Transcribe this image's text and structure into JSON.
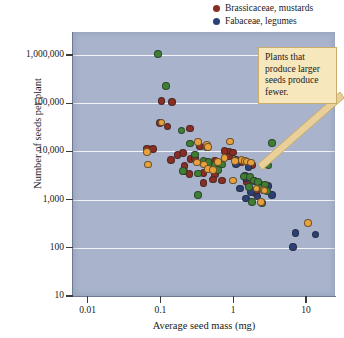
{
  "legend": {
    "items": [
      {
        "label": "Brassicaceae, mustards",
        "color": "#8a2d22",
        "icon": "legend-dot-icon"
      },
      {
        "label": "Fabaceae, legumes",
        "color": "#2b3f78",
        "icon": "legend-dot-icon"
      }
    ]
  },
  "annotation": {
    "text": "Plants that produce larger seeds produce fewer.",
    "background": "#f7e7bd",
    "border": "#c9ab6a"
  },
  "chart_data": {
    "type": "scatter",
    "title": "",
    "xlabel": "Average seed mass (mg)",
    "ylabel": "Number of seeds per plant",
    "xscale": "log",
    "yscale": "log",
    "xlim": [
      0.0063,
      25
    ],
    "ylim": [
      10,
      3000000
    ],
    "xticks": [
      0.01,
      0.1,
      1,
      10
    ],
    "xtick_labels": [
      "0.01",
      "0.1",
      "1",
      "10"
    ],
    "yticks": [
      10,
      100,
      1000,
      10000,
      100000,
      1000000
    ],
    "ytick_labels": [
      "10",
      "100",
      "1,000",
      "10,000",
      "100,000",
      "1,000,000"
    ],
    "grid": "horizontal",
    "legend_position": "top-right",
    "plot_background": "#a9b4cc",
    "gridline_color": "#f2f4f8",
    "series": [
      {
        "name": "Brassicaceae, mustards",
        "color": "#8a2d22",
        "points": [
          [
            0.104,
            110000
          ],
          [
            0.143,
            106000
          ],
          [
            0.098,
            39000
          ],
          [
            0.125,
            33000
          ],
          [
            0.255,
            30000
          ],
          [
            0.066,
            11500
          ],
          [
            0.079,
            11200
          ],
          [
            0.35,
            12600
          ],
          [
            0.205,
            9300
          ],
          [
            0.171,
            8400
          ],
          [
            0.26,
            6900
          ],
          [
            0.3,
            7100
          ],
          [
            0.215,
            5000
          ],
          [
            0.44,
            6200
          ],
          [
            0.56,
            6400
          ],
          [
            0.14,
            6700
          ],
          [
            0.21,
            3800
          ],
          [
            0.25,
            3400
          ],
          [
            0.39,
            3600
          ],
          [
            0.56,
            3300
          ],
          [
            0.53,
            2600
          ],
          [
            0.87,
            9700
          ],
          [
            0.88,
            7900
          ],
          [
            1.1,
            6600
          ],
          [
            1.3,
            5900
          ],
          [
            0.39,
            2200
          ],
          [
            0.7,
            2500
          ],
          [
            1.55,
            2300
          ],
          [
            1.8,
            5200
          ],
          [
            0.76,
            10300
          ],
          [
            1.0,
            9400
          ],
          [
            2.05,
            1350
          ]
        ]
      },
      {
        "name": "Fabaceae, legumes",
        "color": "#2b3f78",
        "points": [
          [
            1.1,
            5500
          ],
          [
            1.45,
            3100
          ],
          [
            1.5,
            2800
          ],
          [
            1.62,
            4800
          ],
          [
            1.95,
            2400
          ],
          [
            2.3,
            2100
          ],
          [
            1.25,
            1700
          ],
          [
            1.75,
            1450
          ],
          [
            2.6,
            1550
          ],
          [
            2.15,
            1150
          ],
          [
            1.5,
            1050
          ],
          [
            3.0,
            1900
          ],
          [
            3.4,
            1250
          ],
          [
            7.2,
            200
          ],
          [
            13.5,
            190
          ],
          [
            6.6,
            105
          ]
        ]
      },
      {
        "name": "Other family (green)",
        "color": "#3f7f33",
        "points": [
          [
            0.093,
            1050000
          ],
          [
            0.12,
            230000
          ],
          [
            0.196,
            27000
          ],
          [
            0.255,
            14500
          ],
          [
            0.44,
            12300
          ],
          [
            0.3,
            8600
          ],
          [
            0.39,
            6400
          ],
          [
            0.46,
            6100
          ],
          [
            0.56,
            5200
          ],
          [
            0.205,
            3900
          ],
          [
            0.33,
            3500
          ],
          [
            0.62,
            4100
          ],
          [
            0.33,
            1250
          ],
          [
            1.4,
            3000
          ],
          [
            1.7,
            2950
          ],
          [
            1.9,
            2500
          ],
          [
            2.2,
            2350
          ],
          [
            1.65,
            1800
          ],
          [
            2.4,
            1750
          ],
          [
            2.75,
            2050
          ],
          [
            1.8,
            900
          ],
          [
            2.5,
            850
          ],
          [
            3.4,
            14800
          ],
          [
            3.05,
            5100
          ],
          [
            2.9,
            1500
          ],
          [
            0.7,
            5400
          ]
        ]
      },
      {
        "name": "Other family (orange)",
        "color": "#e8a13b",
        "points": [
          [
            0.104,
            39500
          ],
          [
            0.066,
            9600
          ],
          [
            0.068,
            5300
          ],
          [
            0.33,
            15800
          ],
          [
            0.44,
            13500
          ],
          [
            0.45,
            12400
          ],
          [
            0.9,
            16200
          ],
          [
            0.32,
            5900
          ],
          [
            0.4,
            5300
          ],
          [
            0.45,
            4300
          ],
          [
            0.53,
            4100
          ],
          [
            0.62,
            6000
          ],
          [
            1.05,
            6300
          ],
          [
            1.3,
            6700
          ],
          [
            1.45,
            6400
          ],
          [
            1.55,
            6200
          ],
          [
            1.0,
            2500
          ],
          [
            2.1,
            1700
          ],
          [
            2.6,
            1600
          ],
          [
            2.7,
            1550
          ],
          [
            2.4,
            880
          ],
          [
            10.6,
            330
          ],
          [
            0.76,
            7200
          ],
          [
            1.75,
            5900
          ]
        ]
      }
    ]
  }
}
